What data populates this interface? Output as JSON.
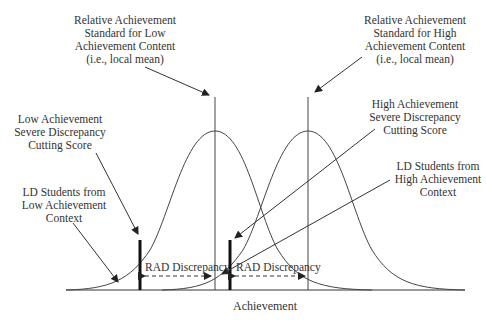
{
  "diagram": {
    "x_axis_label": "Achievement",
    "labels": {
      "low_mean": [
        "Relative Achievement",
        "Standard for Low",
        "Achievement Content",
        "(i.e., local mean)"
      ],
      "high_mean": [
        "Relative Achievement",
        "Standard for High",
        "Achievement Content",
        "(i.e., local mean)"
      ],
      "low_cutting": [
        "Low Achievement",
        "Severe Discrepancy",
        "Cutting Score"
      ],
      "high_cutting": [
        "High Achievement",
        "Severe Discrepancy",
        "Cutting Score"
      ],
      "ld_low": [
        "LD Students from",
        "Low Achievement",
        "Context"
      ],
      "ld_high": [
        "LD Students from",
        "High Achievement",
        "Context"
      ]
    },
    "rad_left": "RAD Discrepancy",
    "rad_right": "RAD Discrepancy",
    "colors": {
      "line": "#333333",
      "text": "#333333",
      "background": "#ffffff"
    }
  }
}
